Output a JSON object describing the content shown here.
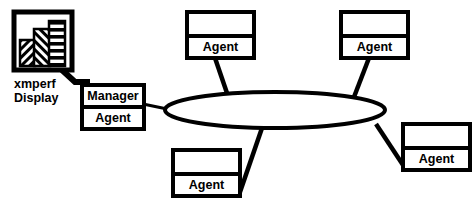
{
  "diagram": {
    "colors": {
      "stroke": "#000000",
      "fill": "#ffffff",
      "background": "#ffffff"
    },
    "display_icon": {
      "name": "xmperf-display-icon",
      "caption_line1": "xmperf",
      "caption_line2": "Display",
      "bars": [
        {
          "hatch": "diagonal-left",
          "label": "bar-1"
        },
        {
          "hatch": "diagonal-right",
          "label": "bar-2"
        },
        {
          "hatch": "horizontal-stripes",
          "label": "bar-3"
        }
      ]
    },
    "manager_node": {
      "name": "manager-node",
      "top_label": "Manager",
      "bottom_label": "Agent"
    },
    "network": {
      "name": "network-ellipse",
      "label": ""
    },
    "agent_nodes": [
      {
        "name": "agent-node-top-left",
        "top_label": "",
        "bottom_label": "Agent"
      },
      {
        "name": "agent-node-top-right",
        "top_label": "",
        "bottom_label": "Agent"
      },
      {
        "name": "agent-node-bottom-right",
        "top_label": "",
        "bottom_label": "Agent"
      },
      {
        "name": "agent-node-bottom-center",
        "top_label": "",
        "bottom_label": "Agent"
      }
    ],
    "connections": [
      {
        "name": "link-display-to-manager",
        "from": "xmperf-display-icon",
        "to": "manager-node"
      },
      {
        "name": "link-manager-to-network",
        "from": "manager-node",
        "to": "network-ellipse"
      },
      {
        "name": "link-network-to-agent-top-left",
        "from": "network-ellipse",
        "to": "agent-node-top-left"
      },
      {
        "name": "link-network-to-agent-top-right",
        "from": "network-ellipse",
        "to": "agent-node-top-right"
      },
      {
        "name": "link-network-to-agent-bottom-right",
        "from": "network-ellipse",
        "to": "agent-node-bottom-right"
      },
      {
        "name": "link-network-to-agent-bottom-center",
        "from": "network-ellipse",
        "to": "agent-node-bottom-center"
      }
    ]
  }
}
